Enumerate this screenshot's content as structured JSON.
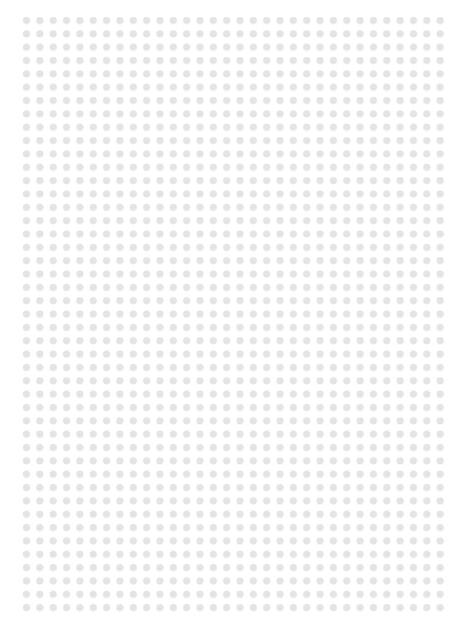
{
  "canvas": {
    "background_color": "#ffffff",
    "width": 470,
    "height": 631
  },
  "header": {
    "clipped_text": "",
    "note": "text clipped above frame; only descender tips visible"
  },
  "dot_grid": {
    "name": "dot-grid-pattern",
    "dot_color": "#e4e4e6",
    "background_color": "#ffffff",
    "dot_diameter_px": 7,
    "spacing_px": 13.35,
    "columns": 32,
    "rows": 45,
    "origin_x_px": 27,
    "origin_y_px": 21,
    "extent_x_px": 442,
    "extent_y_px": 607
  }
}
